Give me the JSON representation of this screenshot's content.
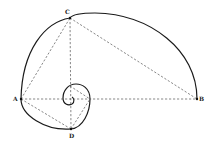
{
  "diagram": {
    "type": "golden-spiral-construction",
    "points": [
      {
        "id": "A",
        "label": "A",
        "x": 21,
        "y": 99
      },
      {
        "id": "B",
        "label": "B",
        "x": 197,
        "y": 99
      },
      {
        "id": "C",
        "label": "C",
        "x": 70,
        "y": 18
      },
      {
        "id": "D",
        "label": "D",
        "x": 71,
        "y": 129
      }
    ],
    "dashed_segments": [
      [
        "A",
        "B"
      ],
      [
        "A",
        "C"
      ],
      [
        "C",
        "B"
      ],
      [
        "A",
        "D"
      ],
      [
        "C",
        "D"
      ]
    ],
    "colors": {
      "spiral": "#1a1a1a",
      "dashed": "#555555",
      "background": "#ffffff"
    }
  }
}
